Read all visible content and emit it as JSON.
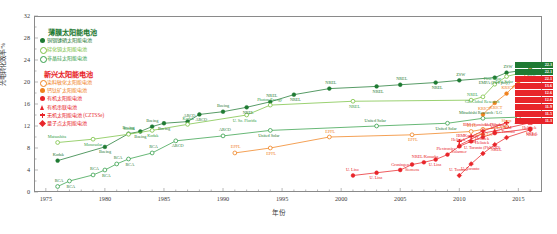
{
  "axes": {
    "ylabel": "光电转化效率/%",
    "xlabel": "年份",
    "yticks": [
      "0",
      "4",
      "8",
      "12",
      "16",
      "20",
      "24",
      "28",
      "32"
    ],
    "ylim": [
      0,
      32
    ],
    "xticks": [
      "1975",
      "1980",
      "1985",
      "1990",
      "1995",
      "2000",
      "2005",
      "2010",
      "2015"
    ],
    "xlim": [
      1974,
      2017
    ],
    "minor_tick_interval": 1
  },
  "legend": {
    "group1": {
      "title": "薄膜太阳能电池",
      "color": "#1f7a33",
      "items": [
        {
          "label": "铜铟镓硒太阳能电池",
          "marker": "filled-circle",
          "color": "#1f7a33"
        },
        {
          "label": "碲化镉太阳能电池",
          "marker": "open-circle",
          "color": "#7ac143"
        },
        {
          "label": "非晶硅太阳能电池",
          "marker": "open-circle",
          "color": "#35a04a"
        }
      ]
    },
    "group2": {
      "title": "新兴太阳能电池",
      "color": "#e8252a",
      "items": [
        {
          "label": "染料敏化太阳能电池",
          "marker": "open-circle",
          "color": "#f0821e"
        },
        {
          "label": "钙钛矿太阳能电池",
          "marker": "filled-circle",
          "color": "#f0821e"
        },
        {
          "label": "有机太阳能电池",
          "marker": "filled-circle",
          "color": "#e8252a"
        },
        {
          "label": "有机串联电池",
          "marker": "triangle",
          "color": "#e8252a"
        },
        {
          "label": "无机太阳能电池 (CZTSSe)",
          "marker": "plus",
          "color": "#e8252a"
        },
        {
          "label": "量子点太阳能电池",
          "marker": "diamond",
          "color": "#e8252a"
        }
      ]
    }
  },
  "chart_data": {
    "type": "line",
    "title": "",
    "xlabel": "年份",
    "ylabel": "光电转化效率/%",
    "xlim": [
      1974,
      2017
    ],
    "ylim": [
      0,
      32
    ],
    "grid": false,
    "legend_position": "top-left",
    "series": [
      {
        "name": "铜铟镓硒太阳能电池",
        "color": "#1f7a33",
        "marker": "filled-circle",
        "end_value": "22.3",
        "points": [
          {
            "x": 1976,
            "y": 5.7,
            "label": "Kodak"
          },
          {
            "x": 1980,
            "y": 8.2,
            "label": "Boeing"
          },
          {
            "x": 1982,
            "y": 10.6,
            "label": "Boeing"
          },
          {
            "x": 1983,
            "y": 11.0,
            "label": "Boeing"
          },
          {
            "x": 1984,
            "y": 11.9,
            "label": "Boeing"
          },
          {
            "x": 1985,
            "y": 12.5,
            "label": "Boeing"
          },
          {
            "x": 1987,
            "y": 12.8,
            "label": "ARCO"
          },
          {
            "x": 1988,
            "y": 14.1,
            "label": "ARCO"
          },
          {
            "x": 1990,
            "y": 14.6,
            "label": "Boeing"
          },
          {
            "x": 1992,
            "y": 15.4,
            "label": "NREL"
          },
          {
            "x": 1994,
            "y": 16.4,
            "label": "NREL"
          },
          {
            "x": 1996,
            "y": 17.7,
            "label": "NREL"
          },
          {
            "x": 1999,
            "y": 18.8,
            "label": "NREL"
          },
          {
            "x": 2003,
            "y": 19.2,
            "label": "NREL"
          },
          {
            "x": 2005,
            "y": 19.5,
            "label": "NREL"
          },
          {
            "x": 2008,
            "y": 19.9,
            "label": "NREL"
          },
          {
            "x": 2010,
            "y": 20.3,
            "label": "ZSW"
          },
          {
            "x": 2013,
            "y": 20.8,
            "label": "EMPA (Flex poly)"
          },
          {
            "x": 2014,
            "y": 21.7,
            "label": "ZSW"
          },
          {
            "x": 2016,
            "y": 22.3,
            "label": "ZSW"
          }
        ]
      },
      {
        "name": "碲化镉太阳能电池",
        "color": "#7ac143",
        "marker": "open-circle",
        "end_value": "22.1",
        "points": [
          {
            "x": 1976,
            "y": 9.0,
            "label": "Matsushita"
          },
          {
            "x": 1979,
            "y": 9.6,
            "label": "Monosolar"
          },
          {
            "x": 1982,
            "y": 10.5,
            "label": "Kodak"
          },
          {
            "x": 1984,
            "y": 11.2,
            "label": "Kodak"
          },
          {
            "x": 1987,
            "y": 12.3,
            "label": "Kodak"
          },
          {
            "x": 1992,
            "y": 14.0,
            "label": "U. So. Florida"
          },
          {
            "x": 1994,
            "y": 15.8,
            "label": "Photon Energy"
          },
          {
            "x": 2001,
            "y": 16.5,
            "label": "NREL"
          },
          {
            "x": 2011,
            "y": 16.7,
            "label": "NREL"
          },
          {
            "x": 2012,
            "y": 17.3,
            "label": "GE Global Research"
          },
          {
            "x": 2013,
            "y": 19.6,
            "label": "First Solar"
          },
          {
            "x": 2014,
            "y": 21.0,
            "label": "First Solar"
          },
          {
            "x": 2016,
            "y": 22.1,
            "label": "First Solar"
          }
        ]
      },
      {
        "name": "非晶硅太阳能电池",
        "color": "#35a04a",
        "marker": "open-circle",
        "end_value": "13.6",
        "points": [
          {
            "x": 1976,
            "y": 1.0,
            "label": "RCA"
          },
          {
            "x": 1977,
            "y": 2.0,
            "label": "RCA"
          },
          {
            "x": 1979,
            "y": 3.1,
            "label": "RCA"
          },
          {
            "x": 1980,
            "y": 4.0,
            "label": "RCA"
          },
          {
            "x": 1981,
            "y": 5.1,
            "label": "RCA"
          },
          {
            "x": 1982,
            "y": 6.0,
            "label": "RCA"
          },
          {
            "x": 1984,
            "y": 7.1,
            "label": "RCA"
          },
          {
            "x": 1986,
            "y": 9.3,
            "label": "ARCO"
          },
          {
            "x": 1990,
            "y": 10.2,
            "label": "ARCO"
          },
          {
            "x": 1994,
            "y": 11.2,
            "label": "United Solar"
          },
          {
            "x": 2003,
            "y": 12.0,
            "label": "United Solar"
          },
          {
            "x": 2009,
            "y": 12.5,
            "label": "United Solar"
          },
          {
            "x": 2012,
            "y": 13.4,
            "label": "Mitsubishi Research / LG"
          },
          {
            "x": 2015,
            "y": 13.6,
            "label": "AIST"
          }
        ]
      },
      {
        "name": "染料敏化太阳能电池",
        "color": "#f0821e",
        "marker": "open-circle",
        "end_value": "11.9",
        "points": [
          {
            "x": 1991,
            "y": 7.1,
            "label": "EPFL"
          },
          {
            "x": 1994,
            "y": 8.0,
            "label": "EPFL"
          },
          {
            "x": 1999,
            "y": 10.0,
            "label": "EPFL"
          },
          {
            "x": 2006,
            "y": 10.4,
            "label": "EPFL"
          },
          {
            "x": 2011,
            "y": 11.0,
            "label": "EPFL"
          },
          {
            "x": 2012,
            "y": 11.4,
            "label": "EPFL/LG"
          },
          {
            "x": 2014,
            "y": 11.9,
            "label": "Sharp"
          }
        ]
      },
      {
        "name": "钙钛矿太阳能电池",
        "color": "#f0821e",
        "marker": "filled-circle",
        "end_value": "22.1",
        "points": [
          {
            "x": 2012,
            "y": 14.1,
            "label": "KRICT"
          },
          {
            "x": 2013,
            "y": 16.2,
            "label": "KRICT"
          },
          {
            "x": 2014,
            "y": 17.9,
            "label": "KRICT"
          },
          {
            "x": 2015,
            "y": 20.1,
            "label": "KRICT"
          },
          {
            "x": 2016,
            "y": 22.1,
            "label": "KRICT/UNIST"
          }
        ]
      },
      {
        "name": "有机太阳能电池",
        "color": "#e8252a",
        "marker": "filled-circle",
        "end_value": "11.5",
        "points": [
          {
            "x": 2001,
            "y": 3.0,
            "label": "U. Linz"
          },
          {
            "x": 2003,
            "y": 3.5,
            "label": "U. Linz"
          },
          {
            "x": 2005,
            "y": 4.0,
            "label": "Groningen"
          },
          {
            "x": 2006,
            "y": 5.0,
            "label": "Siemens"
          },
          {
            "x": 2007,
            "y": 5.4,
            "label": "NREL/Konarka"
          },
          {
            "x": 2008,
            "y": 5.9,
            "label": "U. Linz"
          },
          {
            "x": 2009,
            "y": 6.8,
            "label": "Plextronics"
          },
          {
            "x": 2010,
            "y": 8.3,
            "label": "Solarmer"
          },
          {
            "x": 2011,
            "y": 9.2,
            "label": "Konarka"
          },
          {
            "x": 2012,
            "y": 10.0,
            "label": "Heliatek"
          },
          {
            "x": 2013,
            "y": 10.7,
            "label": "UCLA"
          },
          {
            "x": 2016,
            "y": 11.5,
            "label": "UCLA"
          }
        ]
      },
      {
        "name": "有机串联电池",
        "color": "#e8252a",
        "marker": "triangle",
        "end_value": "12.6",
        "points": [
          {
            "x": 2010,
            "y": 8.5,
            "label": "Heliatek"
          },
          {
            "x": 2012,
            "y": 10.7,
            "label": "Heliatek"
          },
          {
            "x": 2013,
            "y": 11.1,
            "label": "U. Dresden"
          },
          {
            "x": 2016,
            "y": 12.6,
            "label": "Heliatek"
          }
        ]
      },
      {
        "name": "无机太阳能电池 (CZTSSe)",
        "color": "#e8252a",
        "marker": "plus",
        "end_value": "12.6",
        "points": [
          {
            "x": 2010,
            "y": 9.2,
            "label": "IBM"
          },
          {
            "x": 2011,
            "y": 10.1,
            "label": "IBM"
          },
          {
            "x": 2012,
            "y": 11.1,
            "label": "IBM (Sumitomo Chem.)"
          },
          {
            "x": 2014,
            "y": 12.6,
            "label": "IBM"
          }
        ]
      },
      {
        "name": "量子点太阳能电池",
        "color": "#e8252a",
        "marker": "diamond",
        "end_value": "11.3",
        "points": [
          {
            "x": 2010,
            "y": 3.0,
            "label": "U. Toronto"
          },
          {
            "x": 2011,
            "y": 5.1,
            "label": "U. Toronto"
          },
          {
            "x": 2012,
            "y": 7.0,
            "label": "U. Toronto (PbS-QD)"
          },
          {
            "x": 2013,
            "y": 8.6,
            "label": "NREL"
          },
          {
            "x": 2014,
            "y": 9.9,
            "label": "U. Toronto"
          },
          {
            "x": 2016,
            "y": 11.3,
            "label": "NREL"
          }
        ]
      }
    ],
    "end_chips": [
      {
        "label": "ZSW",
        "value": "22.3",
        "color": "#1f7a33",
        "marker": "filled-circle"
      },
      {
        "label": "First Solar",
        "value": "22.1",
        "color": "#1f7a33",
        "marker": "open-circle"
      },
      {
        "label": "KRICT/UNIST",
        "value": "22.1",
        "color": "#e8252a",
        "marker": "filled-circle"
      },
      {
        "label": "Heliatek",
        "value": "13.6",
        "color": "#e8252a",
        "marker": "open-circle"
      },
      {
        "label": "AIST",
        "value": "12.6",
        "color": "#e8252a",
        "marker": "plus"
      },
      {
        "label": "IBM",
        "value": "12.6",
        "color": "#e8252a",
        "marker": "triangle"
      },
      {
        "label": "UCLA",
        "value": "11.9",
        "color": "#e8252a",
        "marker": "filled-circle"
      },
      {
        "label": "NREL",
        "value": "11.5",
        "color": "#e8252a",
        "marker": "filled-circle"
      },
      {
        "label": "U. Toronto",
        "value": "11.3",
        "color": "#e8252a",
        "marker": "diamond"
      }
    ]
  },
  "annotations": {
    "fhg_ise": "FhG-ISE",
    "u_stuttgart": "U. Stuttgart",
    "euro_cis": "Euro-CIS",
    "ametek": "AMETEK",
    "united_solar": "United Solar",
    "sharp": "Sharp",
    "nims": "NIMS",
    "mitsubishi": "Mitsubishi Research",
    "ge_global": "GE Global Research",
    "solar_frontier": "Solar Frontier",
    "empa": "EMPA (Flex poly)",
    "first_solar": "First Solar",
    "matsushita": "Matsushita",
    "u_of_maine": "U. of Maine",
    "monosolar": "Monosolar",
    "photon_energy": "Photon Energy",
    "u_so_florida": "U. So. Florida",
    "epfl": "EPFL",
    "krict": "KRICT",
    "ucla": "UCLA",
    "ibm": "IBM",
    "heliatek": "Heliatek",
    "u_dresden": "U. Dresden",
    "u_toronto": "U. Toronto",
    "pbs_qd": "(PbS-QD)",
    "konarka": "Konarka",
    "solarmer": "Solarmer",
    "plextronics": "Plextronics",
    "siemens": "Siemens",
    "groningen": "Groningen",
    "u_linz": "U. Linz",
    "nrel_konarka": "NREL/Konarka",
    "electronics": "Electronics",
    "sumitomo": "(Sumitomo Chem.)",
    "zsw": "ZSW",
    "nrel": "NREL",
    "arco": "ARCO",
    "boeing": "Boeing",
    "kodak": "Kodak",
    "rca": "RCA"
  }
}
